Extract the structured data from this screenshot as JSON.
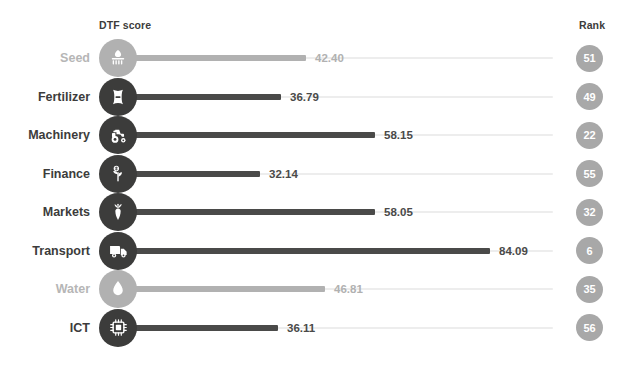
{
  "header": {
    "dtf_label": "DTF score",
    "rank_label": "Rank"
  },
  "colors": {
    "bar_active": "#4a4a49",
    "bar_faded": "#b1b1b1",
    "track": "#ededed",
    "bubble_active": "#3c3c3b",
    "bubble_faded": "#b1b1b1",
    "rank_badge": "#a8a8a8",
    "text_active": "#3c3c3b",
    "text_faded": "#b6b6b6",
    "background": "#ffffff"
  },
  "chart_data": {
    "type": "bar",
    "title": "",
    "xlabel": "DTF score",
    "ylabel": "",
    "xlim": [
      0,
      100
    ],
    "grid": false,
    "orientation": "horizontal",
    "categories": [
      "Seed",
      "Fertilizer",
      "Machinery",
      "Finance",
      "Markets",
      "Transport",
      "Water",
      "ICT"
    ],
    "values": [
      42.4,
      36.79,
      58.15,
      32.14,
      58.05,
      84.09,
      46.81,
      36.11
    ],
    "value_labels": [
      "42.40",
      "36.79",
      "58.15",
      "32.14",
      "58.05",
      "84.09",
      "46.81",
      "36.11"
    ],
    "ranks": [
      51,
      49,
      22,
      55,
      32,
      6,
      35,
      56
    ],
    "rank_labels": [
      "51",
      "49",
      "22",
      "55",
      "32",
      "6",
      "35",
      "56"
    ],
    "icons": [
      "seed-icon",
      "fertilizer-icon",
      "tractor-icon",
      "sprout-coin-icon",
      "carrot-icon",
      "truck-icon",
      "water-drop-icon",
      "microchip-icon"
    ],
    "faded": [
      true,
      false,
      false,
      false,
      false,
      false,
      true,
      false
    ]
  },
  "rows": [
    {
      "label": "Seed",
      "value": "42.40",
      "rank": "51",
      "icon": "seed-icon",
      "faded": true
    },
    {
      "label": "Fertilizer",
      "value": "36.79",
      "rank": "49",
      "icon": "fertilizer-icon",
      "faded": false
    },
    {
      "label": "Machinery",
      "value": "58.15",
      "rank": "22",
      "icon": "tractor-icon",
      "faded": false
    },
    {
      "label": "Finance",
      "value": "32.14",
      "rank": "55",
      "icon": "sprout-coin-icon",
      "faded": false
    },
    {
      "label": "Markets",
      "value": "58.05",
      "rank": "32",
      "icon": "carrot-icon",
      "faded": false
    },
    {
      "label": "Transport",
      "value": "84.09",
      "rank": "6",
      "icon": "truck-icon",
      "faded": false
    },
    {
      "label": "Water",
      "value": "46.81",
      "rank": "35",
      "icon": "water-drop-icon",
      "faded": true
    },
    {
      "label": "ICT",
      "value": "36.11",
      "rank": "56",
      "icon": "microchip-icon",
      "faded": false
    }
  ]
}
